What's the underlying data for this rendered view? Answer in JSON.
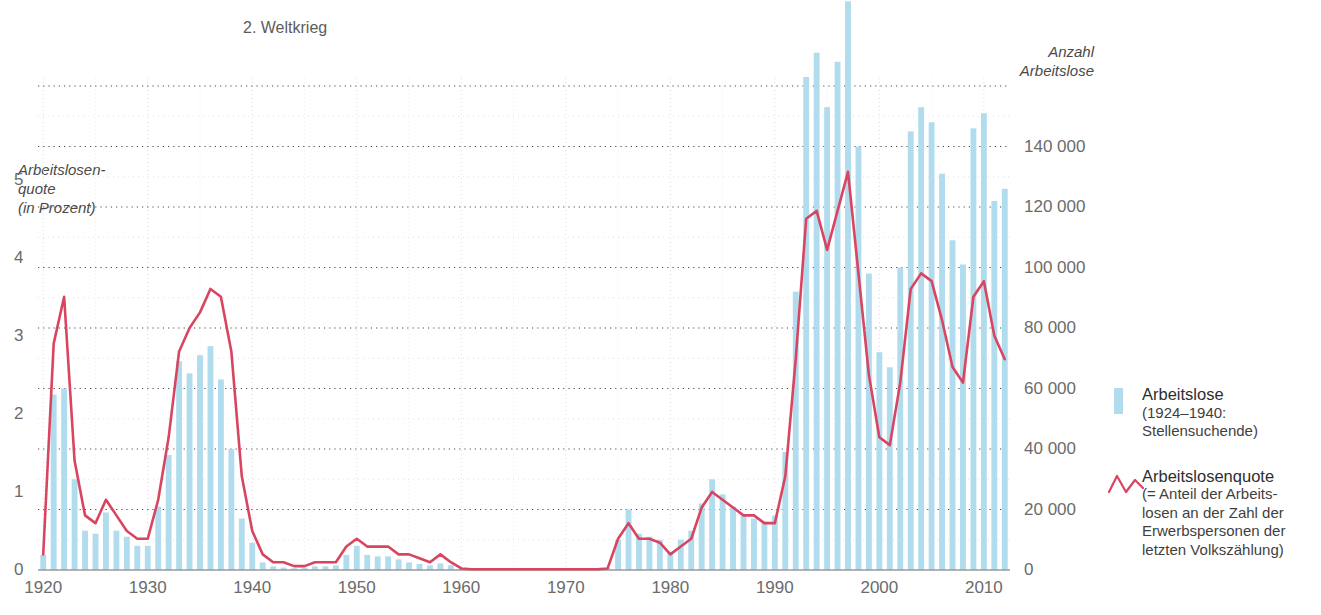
{
  "annotation": {
    "war_label": "2. Weltkrieg"
  },
  "axes": {
    "left_title": "Arbeitslosen-\nquote\n(in Prozent)",
    "right_title": "Anzahl\nArbeitslose",
    "left_ticks": [
      "0",
      "1",
      "2",
      "3",
      "4",
      "5"
    ],
    "right_ticks": [
      "0",
      "20 000",
      "40 000",
      "60 000",
      "80 000",
      "100 000",
      "120 000",
      "140 000"
    ],
    "x_ticks": [
      "1920",
      "1930",
      "1940",
      "1950",
      "1960",
      "1970",
      "1980",
      "1990",
      "2000",
      "2010"
    ]
  },
  "legend": {
    "bars": {
      "title": "Arbeitslose",
      "sub": "(1924–1940:\nStellensuchende)"
    },
    "line": {
      "title": "Arbeitslosenquote",
      "sub": "(= Anteil der Arbeits-\nlosen an der Zahl der\nErwerbspersonen der\nletzten Volkszählung)"
    }
  },
  "colors": {
    "bar": "#b0dced",
    "line": "#d94560",
    "grid_major": "#4a4a4a",
    "grid_minor": "#d8d8d8",
    "axis": "#8a8a8a",
    "text": "#5a5a5a"
  },
  "chart_data": {
    "type": "bar",
    "title": "",
    "xlabel": "",
    "ylabel": "Arbeitslosenquote (in Prozent)",
    "y2label": "Anzahl Arbeitslose",
    "xlim": [
      1919.5,
      2012.5
    ],
    "ylim": [
      0,
      6.2
    ],
    "y2lim": [
      0,
      160000
    ],
    "grid": true,
    "legend_position": "right",
    "x": [
      1920,
      1921,
      1922,
      1923,
      1924,
      1925,
      1926,
      1927,
      1928,
      1929,
      1930,
      1931,
      1932,
      1933,
      1934,
      1935,
      1936,
      1937,
      1938,
      1939,
      1940,
      1941,
      1942,
      1943,
      1944,
      1945,
      1946,
      1947,
      1948,
      1949,
      1950,
      1951,
      1952,
      1953,
      1954,
      1955,
      1956,
      1957,
      1958,
      1959,
      1960,
      1961,
      1962,
      1963,
      1964,
      1965,
      1966,
      1967,
      1968,
      1969,
      1970,
      1971,
      1972,
      1973,
      1974,
      1975,
      1976,
      1977,
      1978,
      1979,
      1980,
      1981,
      1982,
      1983,
      1984,
      1985,
      1986,
      1987,
      1988,
      1989,
      1990,
      1991,
      1992,
      1993,
      1994,
      1995,
      1996,
      1997,
      1998,
      1999,
      2000,
      2001,
      2002,
      2003,
      2004,
      2005,
      2006,
      2007,
      2008,
      2009,
      2010,
      2011,
      2012
    ],
    "series": [
      {
        "name": "Arbeitslose",
        "type": "bar",
        "axis": "right",
        "values": [
          5000,
          58000,
          60000,
          30000,
          13000,
          12000,
          19000,
          13000,
          11000,
          8000,
          8000,
          21000,
          38000,
          69000,
          65000,
          71000,
          74000,
          63000,
          40000,
          17000,
          9000,
          2500,
          1200,
          800,
          600,
          800,
          1200,
          1200,
          1500,
          5000,
          8000,
          5000,
          4500,
          4500,
          3500,
          2500,
          2000,
          1500,
          2200,
          1600,
          400,
          300,
          300,
          300,
          300,
          300,
          300,
          300,
          300,
          300,
          300,
          300,
          300,
          300,
          700,
          10000,
          20000,
          12000,
          11000,
          10000,
          6000,
          10000,
          13000,
          22000,
          30000,
          25000,
          21000,
          18000,
          17000,
          16000,
          18000,
          39000,
          92000,
          163000,
          171000,
          153000,
          168000,
          188000,
          140000,
          98000,
          72000,
          67000,
          100000,
          145000,
          153000,
          148000,
          131000,
          109000,
          101000,
          146000,
          151000,
          122000,
          126000
        ]
      },
      {
        "name": "Arbeitslosenquote",
        "type": "line",
        "axis": "left",
        "values": [
          0.2,
          2.9,
          3.5,
          1.4,
          0.7,
          0.6,
          0.9,
          0.7,
          0.5,
          0.4,
          0.4,
          0.9,
          1.7,
          2.8,
          3.1,
          3.3,
          3.6,
          3.5,
          2.8,
          1.2,
          0.5,
          0.2,
          0.1,
          0.1,
          0.05,
          0.05,
          0.1,
          0.1,
          0.1,
          0.3,
          0.4,
          0.3,
          0.3,
          0.3,
          0.2,
          0.2,
          0.15,
          0.1,
          0.2,
          0.1,
          0.02,
          0.01,
          0.01,
          0.01,
          0.01,
          0.01,
          0.01,
          0.01,
          0.01,
          0.01,
          0.01,
          0.01,
          0.01,
          0.01,
          0.02,
          0.4,
          0.6,
          0.4,
          0.4,
          0.35,
          0.2,
          0.3,
          0.4,
          0.8,
          1.0,
          0.9,
          0.8,
          0.7,
          0.7,
          0.6,
          0.6,
          1.2,
          2.7,
          4.5,
          4.6,
          4.1,
          4.6,
          5.1,
          3.8,
          2.5,
          1.7,
          1.6,
          2.4,
          3.6,
          3.8,
          3.7,
          3.2,
          2.6,
          2.4,
          3.5,
          3.7,
          3.0,
          2.7
        ]
      }
    ]
  }
}
